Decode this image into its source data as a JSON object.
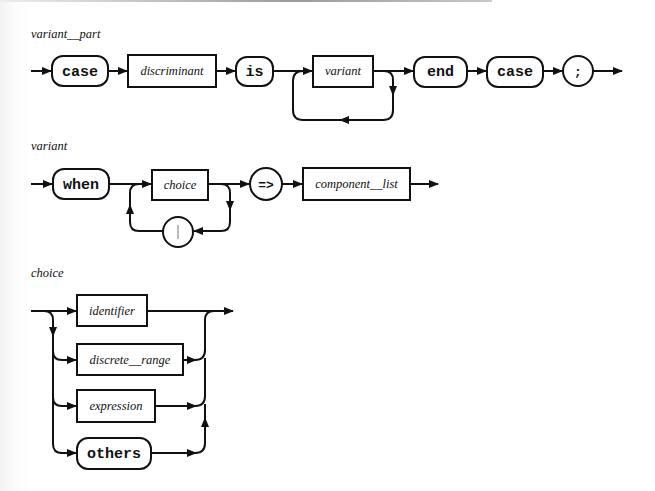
{
  "diagrams": {
    "variant_part": {
      "title": "variant__part",
      "items": {
        "case1": "case",
        "discriminant": "discriminant",
        "is": "is",
        "variant": "variant",
        "end": "end",
        "case2": "case",
        "semicolon": ";"
      }
    },
    "variant": {
      "title": "variant",
      "items": {
        "when": "when",
        "choice": "choice",
        "separator": "|",
        "arrow": "=>",
        "component_list": "component__list"
      }
    },
    "choice": {
      "title": "choice",
      "items": {
        "identifier": "identifier",
        "discrete_range": "discrete__range",
        "expression": "expression",
        "others": "others"
      }
    }
  },
  "legend": {
    "terminal_shape": "rounded box / circle (reserved word or symbol)",
    "nonterminal_shape": "rectangle (syntactic category)"
  }
}
